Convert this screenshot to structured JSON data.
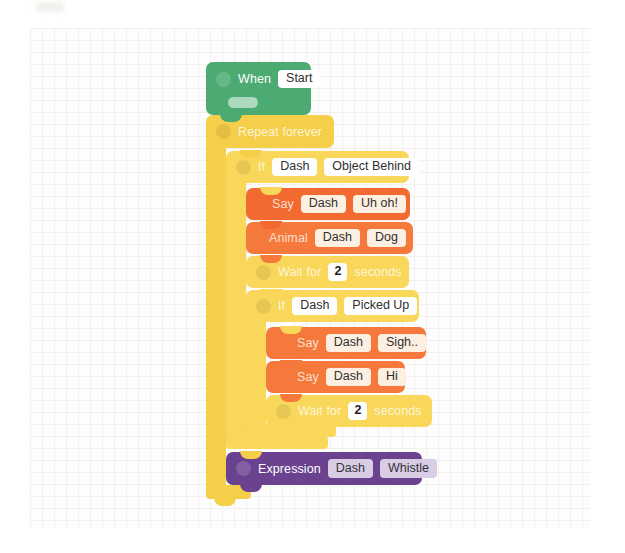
{
  "app": {
    "title": "Blockly visual program canvas",
    "canvas_background": "#fdfdfd"
  },
  "palette": {
    "event_green": "#4bab72",
    "control_yellow": "#f5cf4a",
    "control_yellow_light": "#fadf74",
    "action_orange": "#f26a30",
    "action_orange_alt": "#f4793a",
    "expression_purple": "#6b4290",
    "pill_white": "#ffffff",
    "pill_cream": "#fdf0e3",
    "pill_lavender": "#d9cde4",
    "text_white": "#ffffff"
  },
  "program": {
    "name": "Dash robot program",
    "blocks": [
      {
        "id": "when-start",
        "type": "event",
        "label": "When",
        "value": "Start",
        "has_ghost_slot": true
      },
      {
        "id": "repeat-forever",
        "type": "control-loop",
        "label": "Repeat forever"
      },
      {
        "id": "if-object-behind",
        "type": "control-if",
        "label": "If",
        "subject": "Dash",
        "condition": "Object Behind"
      },
      {
        "id": "say-uh-oh",
        "type": "action-say",
        "label": "Say",
        "subject": "Dash",
        "value": "Uh oh!"
      },
      {
        "id": "animal-dog",
        "type": "action-animal",
        "label": "Animal",
        "subject": "Dash",
        "value": "Dog"
      },
      {
        "id": "wait-1",
        "type": "control-wait",
        "label_before": "Wait for",
        "value": "2",
        "label_after": "seconds"
      },
      {
        "id": "if-picked-up",
        "type": "control-if",
        "label": "If",
        "subject": "Dash",
        "condition": "Picked Up"
      },
      {
        "id": "say-sigh",
        "type": "action-say",
        "label": "Say",
        "subject": "Dash",
        "value": "Sigh.."
      },
      {
        "id": "say-hi",
        "type": "action-say",
        "label": "Say",
        "subject": "Dash",
        "value": "Hi"
      },
      {
        "id": "wait-2",
        "type": "control-wait",
        "label_before": "Wait for",
        "value": "2",
        "label_after": "seconds"
      },
      {
        "id": "expression-whistle",
        "type": "expression",
        "label": "Expression",
        "subject": "Dash",
        "value": "Whistle"
      }
    ]
  }
}
